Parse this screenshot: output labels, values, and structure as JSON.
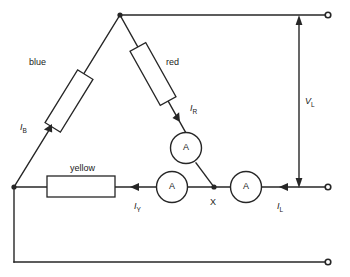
{
  "diagram": {
    "colors": {
      "line": "#262626",
      "text": "#1a1a1a",
      "background": "#ffffff"
    },
    "branch_labels": {
      "blue": "blue",
      "red": "red",
      "yellow": "yellow"
    },
    "current_labels": {
      "i_b": "I",
      "i_b_sub": "B",
      "i_r": "I",
      "i_r_sub": "R",
      "i_y": "I",
      "i_y_sub": "Y",
      "i_l": "I",
      "i_l_sub": "L"
    },
    "voltage_label": {
      "symbol": "V",
      "subscript": "L"
    },
    "node_labels": {
      "x": "X"
    },
    "meters": [
      {
        "name": "ammeter-r",
        "label": "A"
      },
      {
        "name": "ammeter-y",
        "label": "A"
      },
      {
        "name": "ammeter-l",
        "label": "A"
      }
    ],
    "terminals": [
      {
        "name": "terminal-top-right"
      },
      {
        "name": "terminal-middle-right"
      },
      {
        "name": "terminal-bottom-right"
      }
    ]
  }
}
